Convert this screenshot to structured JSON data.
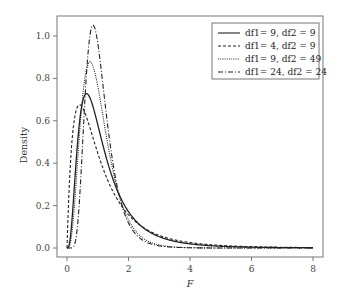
{
  "chart_data": {
    "type": "line",
    "title": "",
    "xlabel": "F",
    "ylabel": "Density",
    "xlim": [
      0,
      8
    ],
    "ylim": [
      0,
      1.05
    ],
    "xticks": [
      "0",
      "2",
      "4",
      "6",
      "8"
    ],
    "yticks": [
      "0.0",
      "0.2",
      "0.4",
      "0.6",
      "0.8",
      "1.0"
    ],
    "grid": false,
    "legend_position": "top-right",
    "series": [
      {
        "name": "df1= 9, df2 = 9",
        "df1": 9,
        "df2": 9,
        "style": "solid",
        "peak_x": 0.64,
        "peak_y": 0.73
      },
      {
        "name": "df1= 4, df2 = 9",
        "df1": 4,
        "df2": 9,
        "style": "dashed",
        "peak_x": 0.38,
        "peak_y": 0.67
      },
      {
        "name": "df1= 9, df2 = 49",
        "df1": 9,
        "df2": 49,
        "style": "dotted",
        "peak_x": 0.74,
        "peak_y": 0.88
      },
      {
        "name": "df1= 24, df2 = 24",
        "df1": 24,
        "df2": 24,
        "style": "dashdot",
        "peak_x": 0.84,
        "peak_y": 1.05
      }
    ]
  }
}
